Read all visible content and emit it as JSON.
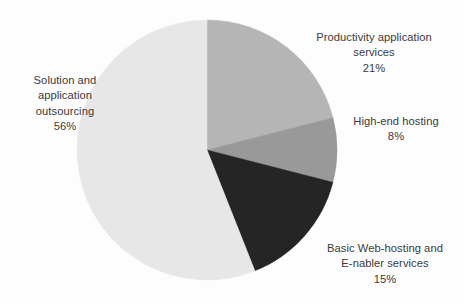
{
  "chart_data": {
    "type": "pie",
    "title": "",
    "subtitle": "",
    "xlabel": "",
    "ylabel": "",
    "legend_position": "none",
    "grid": false,
    "units": "percent",
    "start_angle_deg": 0,
    "direction": "clockwise",
    "categories": [
      "Productivity application services",
      "High-end hosting",
      "Basic Web-hosting and E-nabler services",
      "Solution and application outsourcing"
    ],
    "values": [
      21,
      8,
      15,
      56
    ],
    "colors": [
      "#b5b5b5",
      "#999999",
      "#252525",
      "#e7e7e7"
    ],
    "slices": [
      {
        "name": "Productivity application services",
        "value": 21,
        "value_label": "21%",
        "color": "#b5b5b5",
        "start_deg": 0,
        "end_deg": 75.6
      },
      {
        "name": "High-end hosting",
        "value": 8,
        "value_label": "8%",
        "color": "#999999",
        "start_deg": 75.6,
        "end_deg": 104.4
      },
      {
        "name": "Basic Web-hosting and E-nabler services",
        "value": 15,
        "value_label": "15%",
        "color": "#252525",
        "start_deg": 104.4,
        "end_deg": 158.4
      },
      {
        "name": "Solution and application outsourcing",
        "value": 56,
        "value_label": "56%",
        "color": "#e7e7e7",
        "start_deg": 158.4,
        "end_deg": 360
      }
    ]
  },
  "labels": {
    "productivity": {
      "line1": "Productivity application",
      "line2": "services",
      "percent": "21%",
      "text": "Productivity application\nservices"
    },
    "high_end_hosting": {
      "line1": "High-end hosting",
      "percent": "8%",
      "text": "High-end hosting"
    },
    "basic_web_hosting": {
      "line1": "Basic Web-hosting and",
      "line2": "E-nabler services",
      "percent": "15%",
      "text": "Basic Web-hosting and\nE-nabler services"
    },
    "solution_outsourcing": {
      "line1": "Solution and",
      "line2": "application",
      "line3": "outsourcing",
      "percent": "56%",
      "text": "Solution and\napplication\noutsourcing"
    }
  },
  "geometry": {
    "center_x": 207,
    "center_y": 150,
    "radius": 130
  }
}
